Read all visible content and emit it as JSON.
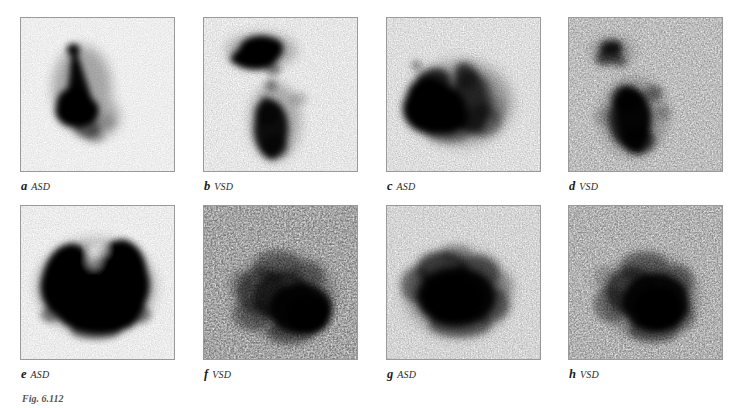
{
  "figure": {
    "caption": "Fig. 6.112",
    "panel_label_letters": [
      "a",
      "b",
      "c",
      "d",
      "e",
      "f",
      "g",
      "h"
    ]
  },
  "panels": [
    {
      "letter": "a",
      "diagnosis": "ASD",
      "name": "panel-a",
      "description": "Narrow cone of tracer widening inferiorly; dense confluent uptake in left-of-centre field",
      "pattern": "cone"
    },
    {
      "letter": "b",
      "diagnosis": "VSD",
      "name": "panel-b",
      "description": "Dense triangular uptake superiorly with separate elongated vertical column of activity inferiorly",
      "pattern": "triangle-column"
    },
    {
      "letter": "c",
      "diagnosis": "ASD",
      "name": "panel-c",
      "description": "Large dense mass at left with diffuse granular activity extending to the right",
      "pattern": "mass-right-spread"
    },
    {
      "letter": "d",
      "diagnosis": "VSD",
      "name": "panel-d",
      "description": "Noisy speckled field with central vertical mass and small superior-left structure",
      "pattern": "noisy-vertical"
    },
    {
      "letter": "e",
      "diagnosis": "ASD",
      "name": "panel-e",
      "description": "Very dense bilobed butterfly-shaped confluent uptake filling most of the field",
      "pattern": "bilobed-dense"
    },
    {
      "letter": "f",
      "diagnosis": "VSD",
      "name": "panel-f",
      "description": "Coarse speckled distribution with densest activity in the lower-right quadrant",
      "pattern": "speckled-lower-right"
    },
    {
      "letter": "g",
      "diagnosis": "ASD",
      "name": "panel-g",
      "description": "Rounded dense central blob with softer granular halo",
      "pattern": "round-dense"
    },
    {
      "letter": "h",
      "diagnosis": "VSD",
      "name": "panel-h",
      "description": "Grainy rounded uptake concentrated centre-right with scattered background counts",
      "pattern": "grainy-round"
    }
  ],
  "colors": {
    "background": "#ffffff",
    "frame_border": "#9a9a9a",
    "tracer_dark": "#000000",
    "label_text": "#1a1a1a",
    "caption_text": "#555555"
  }
}
